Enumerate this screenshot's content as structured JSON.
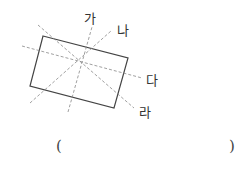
{
  "figure": {
    "shape": "rectangle",
    "rectangle_points": "43,36 128,58 114,108 30,86",
    "lines": [
      {
        "label": "가",
        "x1": 68,
        "y1": 112,
        "x2": 92,
        "y2": 27
      },
      {
        "label": "나",
        "x1": 30,
        "y1": 103,
        "x2": 111,
        "y2": 31
      },
      {
        "label": "다",
        "x1": 22,
        "y1": 46,
        "x2": 142,
        "y2": 78
      },
      {
        "label": "라",
        "x1": 38,
        "y1": 25,
        "x2": 134,
        "y2": 108
      }
    ],
    "labels": {
      "ga": "가",
      "na": "나",
      "da": "다",
      "ra": "라"
    }
  },
  "answer": {
    "open": "(",
    "close": ")"
  }
}
